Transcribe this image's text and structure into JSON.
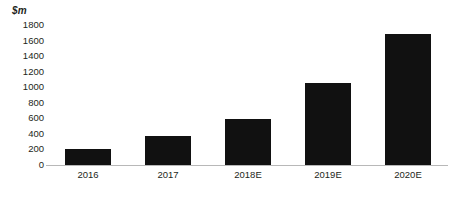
{
  "chart_data": {
    "type": "bar",
    "title": "",
    "subtitle": "",
    "xlabel": "",
    "ylabel": "$m",
    "unit_label": "$m",
    "categories": [
      "2016",
      "2017",
      "2018E",
      "2019E",
      "2020E"
    ],
    "values": [
      200,
      370,
      590,
      1050,
      1690
    ],
    "series": [
      {
        "name": "Revenue",
        "values": [
          200,
          370,
          590,
          1050,
          1690
        ]
      }
    ],
    "ylim": [
      0,
      1800
    ],
    "ytick_step": 200,
    "ytick_labels": [
      "1800",
      "1600",
      "1400",
      "1200",
      "1000",
      "800",
      "600",
      "400",
      "200",
      "0"
    ],
    "ytick_values": [
      1800,
      1600,
      1400,
      1200,
      1000,
      800,
      600,
      400,
      200,
      0
    ],
    "grid": false,
    "legend": false,
    "legend_position": "none",
    "bar_color": "#111111",
    "axis_color": "#b8b8b8",
    "text_color": "#231f20",
    "background_color": "#ffffff"
  }
}
